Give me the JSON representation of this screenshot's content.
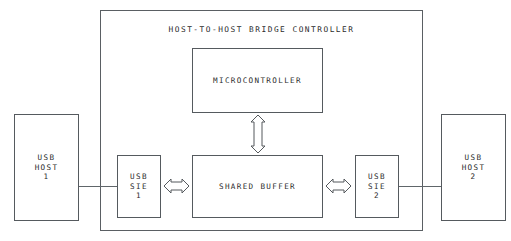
{
  "diagram": {
    "title": "HOST-TO-HOST BRIDGE CONTROLLER",
    "colors": {
      "stroke": "#55595d",
      "text": "#2b2b2b",
      "background": "#ffffff",
      "wire": "#60666a"
    },
    "blocks": {
      "usb_host_1": "USB\nHOST\n1",
      "usb_host_2": "USB\nHOST\n2",
      "usb_sie_1": "USB\nSIE\n1",
      "usb_sie_2": "USB\nSIE\n2",
      "microcontroller": "MICROCONTROLLER",
      "shared_buffer": "SHARED BUFFER"
    },
    "connectors": {
      "host1_to_sie1": "line",
      "host2_to_sie2": "line",
      "sie1_to_buffer": "double-headed-arrow",
      "sie2_to_buffer": "double-headed-arrow",
      "microcontroller_to_buffer": "double-headed-arrow"
    }
  }
}
